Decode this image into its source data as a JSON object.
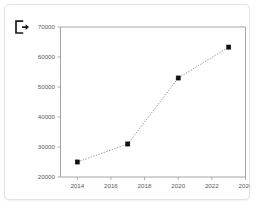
{
  "card": {
    "background_color": "#ffffff",
    "border_color": "#e3e3e3"
  },
  "toolbar": {
    "export_icon": "export-arrow-icon"
  },
  "chart_data": {
    "type": "line",
    "title": "",
    "subtitle": "",
    "xlabel": "",
    "ylabel": "",
    "x": [
      2014,
      2017,
      2020,
      2023
    ],
    "values": [
      25000,
      31000,
      53000,
      63300
    ],
    "series": [
      {
        "name": "",
        "x": [
          2014,
          2017,
          2020,
          2023
        ],
        "values": [
          25000,
          31000,
          53000,
          63300
        ]
      }
    ],
    "xlim": [
      2013,
      2024
    ],
    "ylim": [
      20000,
      70000
    ],
    "xticks": [
      2014,
      2016,
      2018,
      2020,
      2022,
      2024
    ],
    "xtick_labels": [
      "2014",
      "2016",
      "2018",
      "2020",
      "2022",
      "2024"
    ],
    "yticks": [
      20000,
      30000,
      40000,
      50000,
      60000,
      70000
    ],
    "ytick_labels": [
      "20000",
      "30000",
      "40000",
      "50000",
      "60000",
      "70000"
    ],
    "grid": false,
    "legend": false,
    "legend_position": "none",
    "line_style": "dotted",
    "line_color": "#8d8d8d",
    "marker_style": "square",
    "marker_color": "#111111",
    "annotations": []
  }
}
